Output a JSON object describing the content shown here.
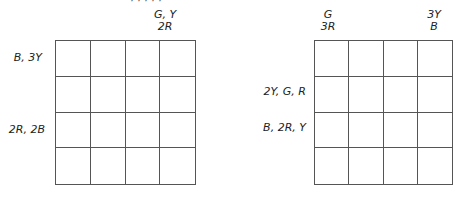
{
  "clipped_caption": "· · · · ·",
  "left_grid": {
    "rows": 4,
    "cols": 4,
    "top_labels": [
      {
        "col": 3,
        "line1": "G, Y",
        "line2": "2R"
      }
    ],
    "side_labels": [
      {
        "row": 1,
        "text": "B, 3Y"
      },
      {
        "row": 3,
        "text": "2R, 2B"
      }
    ]
  },
  "right_grid": {
    "rows": 4,
    "cols": 4,
    "top_labels": [
      {
        "col": 1,
        "line1": "G",
        "line2": "3R"
      },
      {
        "col": 4,
        "line1": "3Y",
        "line2": "B"
      }
    ],
    "side_labels": [
      {
        "row": 2,
        "text": "2Y, G, R"
      },
      {
        "row": 3,
        "text": "B, 2R, Y"
      }
    ]
  }
}
